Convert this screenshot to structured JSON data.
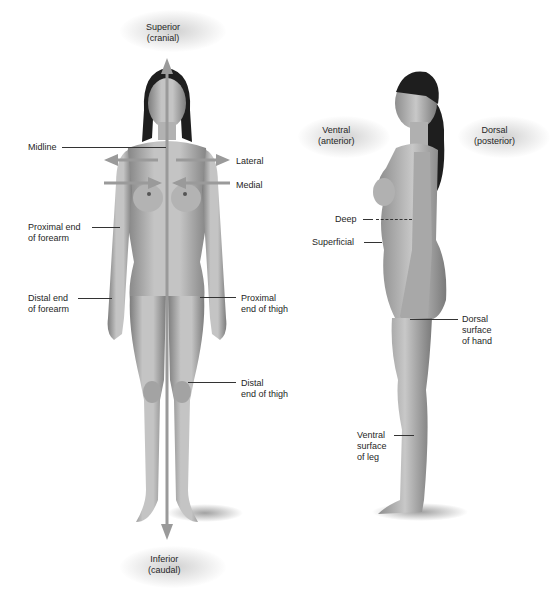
{
  "diagram": {
    "figures": {
      "anterior_view": {
        "labels": {
          "superior": [
            "Superior",
            "(cranial)"
          ],
          "inferior": [
            "Inferior",
            "(caudal)"
          ],
          "midline": "Midline",
          "lateral": "Lateral",
          "medial": "Medial",
          "proximal_forearm": [
            "Proximal end",
            "of forearm"
          ],
          "distal_forearm": [
            "Distal end",
            "of forearm"
          ],
          "proximal_thigh": [
            "Proximal",
            "end of thigh"
          ],
          "distal_thigh": [
            "Distal",
            "end of thigh"
          ]
        }
      },
      "lateral_view": {
        "labels": {
          "ventral": [
            "Ventral",
            "(anterior)"
          ],
          "dorsal": [
            "Dorsal",
            "(posterior)"
          ],
          "deep": "Deep",
          "superficial": "Superficial",
          "dorsal_hand": [
            "Dorsal",
            "surface",
            "of hand"
          ],
          "ventral_leg": [
            "Ventral",
            "surface",
            "of leg"
          ]
        }
      }
    },
    "colors": {
      "skin_light": "#c9c9c9",
      "skin_dark": "#8a8a8a",
      "hair": "#1e1e1e",
      "arrow": "#9a9a9a",
      "leader": "#333333"
    }
  }
}
